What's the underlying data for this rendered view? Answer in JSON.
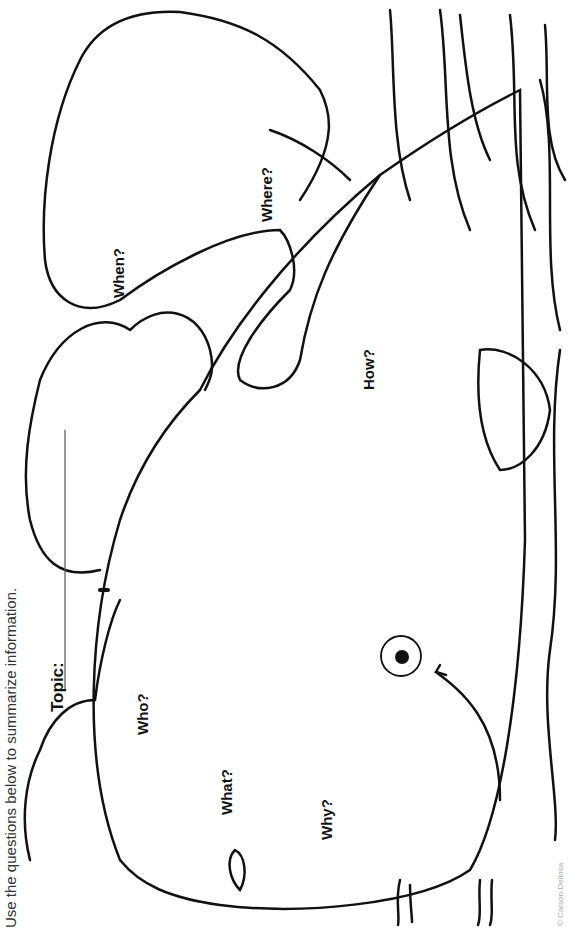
{
  "worksheet": {
    "instructions": "Use the questions below to summarize information.",
    "topic_label": "Topic:",
    "questions": {
      "who": "Who?",
      "what": "What?",
      "why": "Why?",
      "when": "When?",
      "where": "Where?",
      "how": "How?"
    },
    "copyright": "© Carson-Dellosa"
  }
}
